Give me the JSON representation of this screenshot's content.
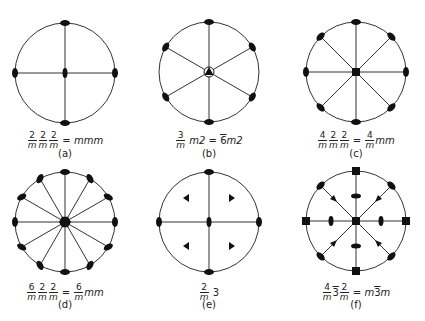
{
  "figure": {
    "panels": [
      {
        "id": "a",
        "letter": "(a)",
        "formula_full": "2/m 2/m 2/m = mmm",
        "cx": 65,
        "cy": 73,
        "r": 50,
        "axes_deg": [
          0,
          90
        ],
        "rim_symbol": "ellipse",
        "center_symbol": "ellipse"
      },
      {
        "id": "b",
        "letter": "(b)",
        "formula_full": "3/m m2 = 6̄m2",
        "cx": 209,
        "cy": 72,
        "r": 50,
        "axes_deg": [
          90,
          150,
          210
        ],
        "rim_symbol": "ellipse",
        "center_symbol": "triangle-in-circle"
      },
      {
        "id": "c",
        "letter": "(c)",
        "formula_full": "4/m 2/m 2/m = 4/m mm",
        "cx": 356,
        "cy": 72,
        "r": 50,
        "axes_deg": [
          0,
          45,
          90,
          135
        ],
        "rim_symbol": "ellipse",
        "center_symbol": "square"
      },
      {
        "id": "d",
        "letter": "(d)",
        "formula_full": "6/m 2/m 2/m = 6/m mm",
        "cx": 65,
        "cy": 222,
        "r": 50,
        "axes_deg": [
          0,
          30,
          60,
          90,
          120,
          150
        ],
        "rim_symbol": "ellipse",
        "center_symbol": "hexagon"
      },
      {
        "id": "e",
        "letter": "(e)",
        "formula_full": "2/m 3",
        "cx": 209,
        "cy": 222,
        "r": 50,
        "axes_deg": [
          0,
          90
        ],
        "rim_symbol": "ellipse",
        "center_symbol": "ellipse"
      },
      {
        "id": "f",
        "letter": "(f)",
        "formula_full": "4/m 3̄ 2/m = m3̄m",
        "cx": 356,
        "cy": 221,
        "r": 50,
        "axes_deg": [
          0,
          45,
          90,
          135
        ],
        "rim_symbol": "mixed",
        "center_symbol": "square"
      }
    ],
    "labels": {
      "a": {
        "n1": "2",
        "d1": "m",
        "n2": "2",
        "d2": "m",
        "n3": "2",
        "d3": "m",
        "eq": "=",
        "rhs": "mmm",
        "letter": "(a)"
      },
      "b": {
        "n1": "3",
        "d1": "m",
        "mid": "m2",
        "eq": "=",
        "rhs_bar": "6",
        "rhs": "m2",
        "letter": "(b)"
      },
      "c": {
        "n1": "4",
        "d1": "m",
        "n2": "2",
        "d2": "m",
        "n3": "2",
        "d3": "m",
        "eq": "=",
        "rn": "4",
        "rd": "m",
        "rhs": "mm",
        "letter": "(c)"
      },
      "d": {
        "n1": "6",
        "d1": "m",
        "n2": "2",
        "d2": "m",
        "n3": "2",
        "d3": "m",
        "eq": "=",
        "rn": "6",
        "rd": "m",
        "rhs": "mm",
        "letter": "(d)"
      },
      "e": {
        "n1": "2",
        "d1": "m",
        "rhs": "3",
        "letter": "(e)"
      },
      "f": {
        "n1": "4",
        "d1": "m",
        "bar3": "3",
        "n2": "2",
        "d2": "m",
        "eq": "=",
        "r1": "m",
        "rbar": "3",
        "r2": "m",
        "letter": "(f)"
      }
    }
  }
}
